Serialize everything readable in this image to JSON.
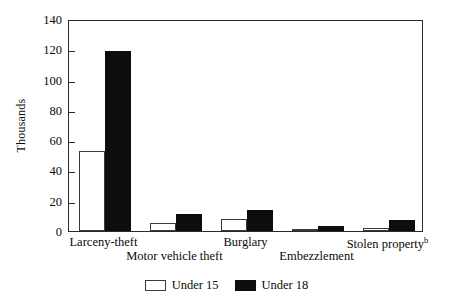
{
  "chart_data": {
    "type": "bar",
    "title": "",
    "xlabel": "",
    "ylabel": "Thousands",
    "ylim": [
      0,
      140
    ],
    "yticks": [
      0,
      20,
      40,
      60,
      80,
      100,
      120,
      140
    ],
    "ytick_labels": [
      "0",
      "20",
      "40",
      "60",
      "80",
      "100",
      "120",
      "140"
    ],
    "grid": false,
    "legend_position": "bottom-center",
    "categories": [
      "Larceny-theft",
      "Motor vehicle theft",
      "Burglary",
      "Embezzlement",
      "Stolen property"
    ],
    "category_notes": {
      "Stolen property": "b"
    },
    "series": [
      {
        "name": "Under 15",
        "color": "#ffffff",
        "values": [
          53,
          5,
          8,
          1,
          2
        ]
      },
      {
        "name": "Under 18",
        "color": "#0d0d0d",
        "values": [
          119,
          11,
          14,
          3,
          7
        ]
      }
    ]
  },
  "axis": {
    "y_title": "Thousands",
    "ticks": [
      {
        "value": 140,
        "label": "140"
      },
      {
        "value": 120,
        "label": "120"
      },
      {
        "value": 100,
        "label": "100"
      },
      {
        "value": 80,
        "label": "80"
      },
      {
        "value": 60,
        "label": "60"
      },
      {
        "value": 40,
        "label": "40"
      },
      {
        "value": 20,
        "label": "20"
      },
      {
        "value": 0,
        "label": "0"
      }
    ]
  },
  "x_labels": [
    {
      "text": "Larceny-theft",
      "note": "",
      "row": 0
    },
    {
      "text": "Motor vehicle theft",
      "note": "",
      "row": 1
    },
    {
      "text": "Burglary",
      "note": "",
      "row": 0
    },
    {
      "text": "Embezzlement",
      "note": "",
      "row": 1
    },
    {
      "text": "Stolen property",
      "note": "b",
      "row": 0
    }
  ],
  "legend": {
    "items": [
      {
        "label": "Under 15",
        "swatch": "u15"
      },
      {
        "label": "Under 18",
        "swatch": "u18"
      }
    ]
  }
}
